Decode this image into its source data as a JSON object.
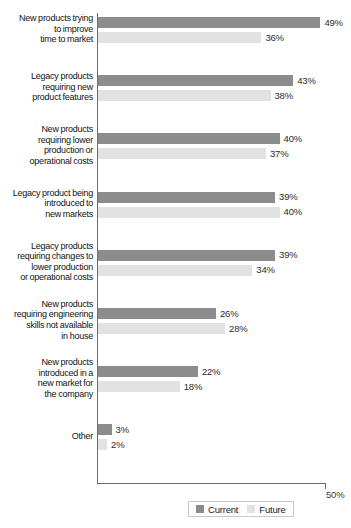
{
  "chart_data": {
    "type": "bar",
    "orientation": "horizontal",
    "title": "",
    "xlabel": "",
    "ylabel": "",
    "xlim": [
      0,
      50
    ],
    "axis_max_label": "50%",
    "grid": false,
    "legend_position": "bottom-center",
    "categories": [
      "New products trying to improve time to market",
      "Legacy products requiring new product features",
      "New products requiring lower production or operational costs",
      "Legacy product being introduced to new markets",
      "Legacy products requiring changes to lower production or operational costs",
      "New products requiring engineering skills not available in house",
      "New products introduced in a new market for the company",
      "Other"
    ],
    "category_lines": [
      [
        "New products trying",
        "to improve",
        "time to market"
      ],
      [
        "Legacy products",
        "requiring new",
        "product features"
      ],
      [
        "New products",
        "requiring lower",
        "production or",
        "operational costs"
      ],
      [
        "Legacy product being",
        "introduced to",
        "new markets"
      ],
      [
        "Legacy products",
        "requiring changes to",
        "lower production",
        "or operational costs"
      ],
      [
        "New products",
        "requiring engineering",
        "skills not available",
        "in house"
      ],
      [
        "New products",
        "introduced in a",
        "new market for",
        "the company"
      ],
      [
        "Other"
      ]
    ],
    "series": [
      {
        "name": "Current",
        "color": "#8c8c8c",
        "values": [
          49,
          43,
          40,
          39,
          39,
          26,
          22,
          3
        ],
        "labels": [
          "49%",
          "43%",
          "40%",
          "39%",
          "39%",
          "26%",
          "22%",
          "3%"
        ]
      },
      {
        "name": "Future",
        "color": "#e2e2e2",
        "values": [
          36,
          38,
          37,
          40,
          34,
          28,
          18,
          2
        ],
        "labels": [
          "36%",
          "38%",
          "37%",
          "40%",
          "34%",
          "28%",
          "18%",
          "2%"
        ]
      }
    ]
  },
  "legend": {
    "items": [
      {
        "label": "Current",
        "color": "#8c8c8c"
      },
      {
        "label": "Future",
        "color": "#e2e2e2"
      }
    ]
  }
}
